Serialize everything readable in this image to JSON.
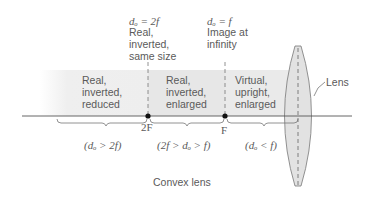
{
  "diagram": {
    "title": "Convex lens",
    "lens_label": "Lens",
    "markers": [
      {
        "id": "2F",
        "label": "2F",
        "header_eq": "dₒ = 2f",
        "header_text": "Real,\ninverted,\nsame size"
      },
      {
        "id": "F",
        "label": "F",
        "header_eq": "dₒ = f",
        "header_text": "Image at\ninfinity"
      }
    ],
    "regions": [
      {
        "description": "Real,\ninverted,\nreduced",
        "condition": "(dₒ > 2f)"
      },
      {
        "description": "Real,\ninverted,\nenlarged",
        "condition": "(2f > dₒ > f)"
      },
      {
        "description": "Virtual,\nupright,\nenlarged",
        "condition": "(dₒ < f)"
      }
    ],
    "colors": {
      "line": "#555555",
      "band_light": "#eeeeee",
      "band_mid": "#e6e6e6",
      "lens_fill": "#e3e3e3",
      "dot": "#111111"
    }
  }
}
